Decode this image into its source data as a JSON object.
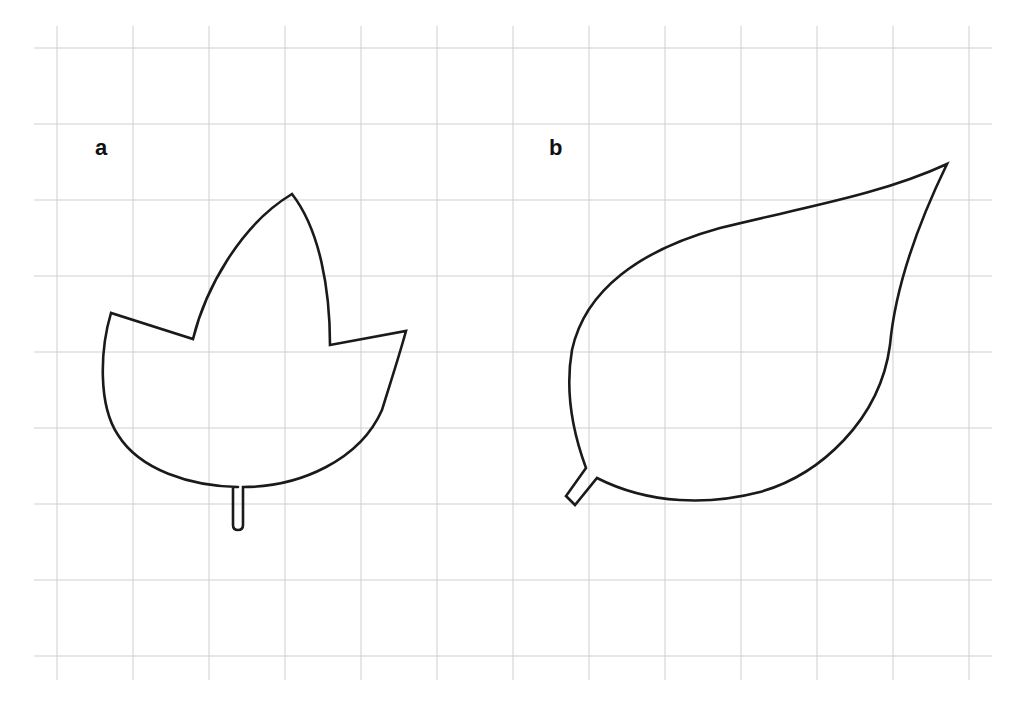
{
  "figure": {
    "background": "#ffffff",
    "grid": {
      "color": "#cfcfcf",
      "vertical_x": [
        57,
        133,
        209,
        285,
        361,
        437,
        513,
        589,
        665,
        741,
        817,
        893,
        969
      ],
      "horizontal_y": [
        48,
        124,
        200,
        276,
        352,
        428,
        504,
        580,
        656
      ],
      "x_extent": [
        34,
        992
      ],
      "y_extent": [
        26,
        680
      ]
    },
    "panels": [
      {
        "id": "a",
        "label": "a",
        "label_pos": [
          95,
          155
        ],
        "description": "three-lobed leaf outline with straight stalk",
        "stroke": "#1a1a1a",
        "path": "M 238 487 C 190 486 140 470 118 435 C 98 405 100 350 111 313 L 193 339 C 205 290 240 225 292 194 C 320 230 330 290 330 345 L 406 331 C 398 360 388 390 382 410 C 360 460 300 487 243 487 L 243 525 Q 243 530 238 530 Q 233 530 233 525 L 233 487"
      },
      {
        "id": "b",
        "label": "b",
        "label_pos": [
          549,
          155
        ],
        "description": "simple ovate leaf outline with short angled stalk",
        "stroke": "#1a1a1a",
        "path": "M 586 468 C 572 430 565 390 572 350 C 585 290 640 250 720 228 C 800 208 880 195 947 164 C 915 230 895 290 890 345 C 880 420 820 475 760 492 C 710 505 650 505 597 478 L 575 505 L 566 496 L 586 468"
      }
    ]
  }
}
